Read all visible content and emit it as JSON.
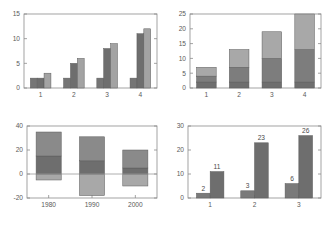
{
  "figure": {
    "title": "",
    "panel_count": 4,
    "background": "#ffffff",
    "axis_color": "#8c8c8c",
    "label_color": "#5a5a5a"
  },
  "chart_data": [
    {
      "id": "top-left",
      "type": "bar",
      "title": "",
      "xlabel": "",
      "ylabel": "",
      "grid": false,
      "legend": "none",
      "categories": [
        "1",
        "2",
        "3",
        "4"
      ],
      "xticklabels": [
        "1",
        "2",
        "3",
        "4"
      ],
      "yticks": [
        0,
        5,
        10,
        15
      ],
      "yticklabels": [
        "0",
        "5",
        "10",
        "15"
      ],
      "ylim": [
        0,
        15
      ],
      "bar_mode": "grouped",
      "series": [
        {
          "name": "series-1",
          "color": "#757575",
          "values": [
            2,
            2,
            2,
            2
          ]
        },
        {
          "name": "series-2",
          "color": "#6e6e6e",
          "values": [
            2,
            5,
            8,
            11
          ]
        },
        {
          "name": "series-3",
          "color": "#a3a3a3",
          "values": [
            3,
            6,
            9,
            12
          ]
        }
      ]
    },
    {
      "id": "top-right",
      "type": "bar",
      "title": "",
      "xlabel": "",
      "ylabel": "",
      "grid": false,
      "legend": "none",
      "categories": [
        "1",
        "2",
        "3",
        "4"
      ],
      "xticklabels": [
        "1",
        "2",
        "3",
        "4"
      ],
      "yticks": [
        0,
        5,
        10,
        15,
        20,
        25
      ],
      "yticklabels": [
        "0",
        "5",
        "10",
        "15",
        "20",
        "25"
      ],
      "ylim": [
        0,
        25
      ],
      "bar_mode": "stacked",
      "series": [
        {
          "name": "series-1",
          "color": "#6e6e6e",
          "values": [
            2,
            2,
            2,
            2
          ]
        },
        {
          "name": "series-2",
          "color": "#7d7d7d",
          "values": [
            2,
            5,
            8,
            11
          ]
        },
        {
          "name": "series-3",
          "color": "#a8a8a8",
          "values": [
            3,
            6,
            9,
            12
          ]
        }
      ],
      "stack_tops": [
        7,
        13,
        19,
        25
      ]
    },
    {
      "id": "bottom-left",
      "type": "bar",
      "title": "",
      "xlabel": "",
      "ylabel": "",
      "grid": false,
      "legend": "none",
      "categories": [
        "1980",
        "1990",
        "2000"
      ],
      "xticklabels": [
        "1980",
        "1990",
        "2000"
      ],
      "yticks": [
        -20,
        0,
        20,
        40
      ],
      "yticklabels": [
        "-20",
        "0",
        "20",
        "40"
      ],
      "ylim": [
        -20,
        40
      ],
      "bar_mode": "stacked-signed",
      "series": [
        {
          "name": "series-1",
          "color": "#a8a8a8",
          "values": [
            -5,
            -18,
            -10
          ]
        },
        {
          "name": "series-2",
          "color": "#6e6e6e",
          "values": [
            15,
            11,
            5
          ]
        },
        {
          "name": "series-3",
          "color": "#8a8a8a",
          "values": [
            35,
            31,
            20
          ]
        }
      ],
      "zero_reference": 0
    },
    {
      "id": "bottom-right",
      "type": "bar",
      "title": "",
      "xlabel": "",
      "ylabel": "",
      "grid": false,
      "legend": "none",
      "categories": [
        "1",
        "2",
        "3"
      ],
      "xticklabels": [
        "1",
        "2",
        "3"
      ],
      "yticks": [
        0,
        10,
        20,
        30
      ],
      "yticklabels": [
        "0",
        "10",
        "20",
        "30"
      ],
      "ylim": [
        0,
        30
      ],
      "bar_mode": "grouped",
      "show_data_labels": true,
      "series": [
        {
          "name": "series-1",
          "color": "#7a7a7a",
          "values": [
            2,
            3,
            6
          ]
        },
        {
          "name": "series-2",
          "color": "#6e6e6e",
          "values": [
            11,
            23,
            26
          ]
        }
      ],
      "data_labels": [
        "2",
        "11",
        "3",
        "23",
        "6",
        "26"
      ]
    }
  ]
}
